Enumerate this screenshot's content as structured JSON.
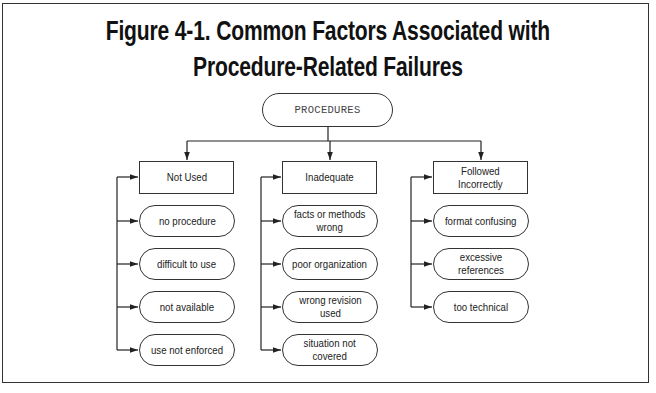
{
  "figure": {
    "title_line1": "Figure 4-1. Common Factors Associated with",
    "title_line2": "Procedure-Related Failures"
  },
  "root": {
    "label": "PROCEDURES"
  },
  "columns": [
    {
      "header": "Not Used",
      "items": [
        "no procedure",
        "difficult to use",
        "not available",
        "use not enforced"
      ]
    },
    {
      "header": "Inadequate",
      "items": [
        "facts or methods\nwrong",
        "poor organization",
        "wrong revision\nused",
        "situation not\ncovered"
      ]
    },
    {
      "header": "Followed\nIncorrectly",
      "items": [
        "format confusing",
        "excessive\nreferences",
        "too technical"
      ]
    }
  ],
  "colors": {
    "line": "#222222",
    "text": "#1a1a1a",
    "background": "#ffffff"
  }
}
